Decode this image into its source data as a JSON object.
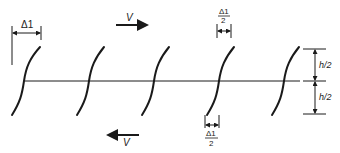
{
  "diagram": {
    "labels": {
      "delta_top": "Δ1",
      "delta_half_top_num": "Δ1",
      "delta_half_top_den": "2",
      "delta_half_bottom_num": "Δ1",
      "delta_half_bottom_den": "2",
      "velocity_top": "V",
      "velocity_bottom": "V",
      "h_half_top": "h/2",
      "h_half_bottom": "h/2"
    },
    "curves_count": 5,
    "colors": {
      "stroke": "#1a1a1a",
      "background": "#ffffff"
    }
  }
}
